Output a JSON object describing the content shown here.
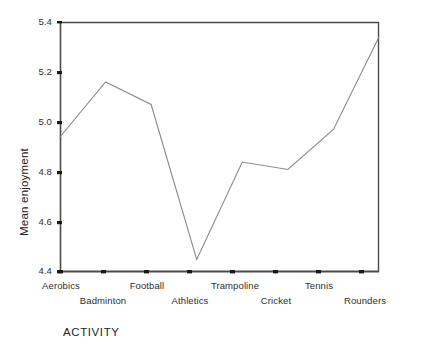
{
  "chart_data": {
    "type": "line",
    "title": "",
    "xlabel": "ACTIVITY",
    "ylabel": "Mean enjoyment",
    "categories": [
      "Aerobics",
      "Badminton",
      "Football",
      "Athletics",
      "Trampoline",
      "Cricket",
      "Tennis",
      "Rounders"
    ],
    "values": [
      4.94,
      5.16,
      5.07,
      4.45,
      4.84,
      4.81,
      4.97,
      5.34
    ],
    "series": [
      {
        "name": "Mean enjoyment",
        "values": [
          4.94,
          5.16,
          5.07,
          4.45,
          4.84,
          4.81,
          4.97,
          5.34
        ]
      }
    ],
    "ylim": [
      4.4,
      5.4
    ],
    "yticks": [
      "4.4",
      "4.6",
      "4.8",
      "5.0",
      "5.2",
      "5.4"
    ],
    "ytick_values": [
      4.4,
      4.6,
      4.8,
      5.0,
      5.2,
      5.4
    ],
    "grid": false,
    "legend": "none",
    "line_color": "#8a8a8a",
    "axis_color": "#3a3a3a"
  },
  "axes": {
    "y_title": "Mean enjoyment",
    "x_title": "ACTIVITY",
    "y_ticks": [
      {
        "label": "5.4"
      },
      {
        "label": "5.2"
      },
      {
        "label": "5.0"
      },
      {
        "label": "4.8"
      },
      {
        "label": "4.6"
      },
      {
        "label": "4.4"
      }
    ],
    "x_ticks": [
      {
        "label": "Aerobics",
        "row": 0
      },
      {
        "label": "Badminton",
        "row": 1
      },
      {
        "label": "Football",
        "row": 0
      },
      {
        "label": "Athletics",
        "row": 1
      },
      {
        "label": "Trampoline",
        "row": 0
      },
      {
        "label": "Cricket",
        "row": 1
      },
      {
        "label": "Tennis",
        "row": 0
      },
      {
        "label": "Rounders",
        "row": 1
      }
    ]
  }
}
